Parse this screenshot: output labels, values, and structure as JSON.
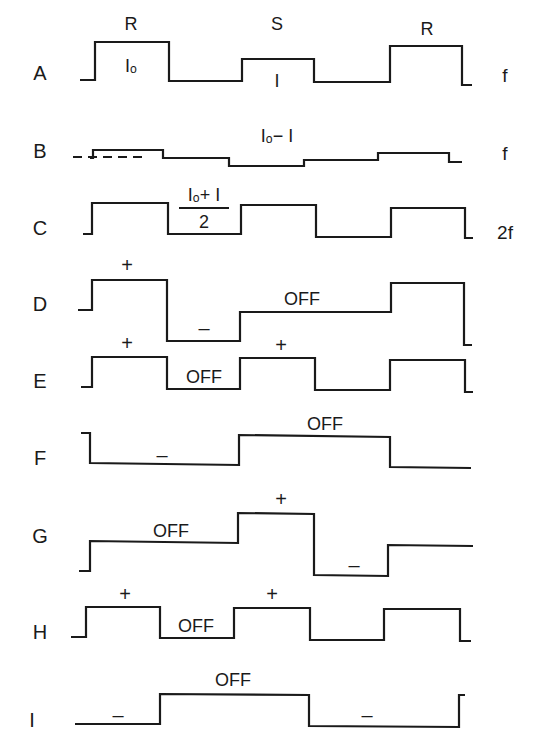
{
  "diagram": {
    "stroke_color": "#1a1a1a",
    "background": "#ffffff",
    "rows": [
      {
        "id": "A",
        "label": "A",
        "label_pos": [
          40,
          80
        ],
        "freq": "f",
        "freq_pos": [
          505,
          82
        ],
        "points": [
          [
            80,
            80
          ],
          [
            95,
            80
          ],
          [
            95,
            42
          ],
          [
            169,
            42
          ],
          [
            169,
            81
          ],
          [
            242,
            81
          ],
          [
            242,
            59
          ],
          [
            314,
            59
          ],
          [
            314,
            82
          ],
          [
            390,
            82
          ],
          [
            390,
            46
          ],
          [
            462,
            46
          ],
          [
            462,
            85
          ],
          [
            472,
            85
          ]
        ],
        "annotations": [
          {
            "text": "R",
            "pos": [
              131,
              30
            ],
            "cls": "annot"
          },
          {
            "text": "Iₒ",
            "pos": [
              131,
              72
            ],
            "cls": "annot"
          },
          {
            "text": "S",
            "pos": [
              277,
              30
            ],
            "cls": "annot"
          },
          {
            "text": "I",
            "pos": [
              277,
              87
            ],
            "cls": "annot"
          },
          {
            "text": "R",
            "pos": [
              427,
              35
            ],
            "cls": "annot"
          }
        ]
      },
      {
        "id": "B",
        "label": "B",
        "label_pos": [
          40,
          158
        ],
        "freq": "f",
        "freq_pos": [
          505,
          160
        ],
        "points": [
          [
            90,
            158
          ],
          [
            93,
            158
          ],
          [
            93,
            150
          ],
          [
            163,
            150
          ],
          [
            163,
            158
          ],
          [
            229,
            158
          ],
          [
            229,
            166
          ],
          [
            304,
            166
          ],
          [
            304,
            160
          ],
          [
            378,
            160
          ],
          [
            378,
            153
          ],
          [
            449,
            153
          ],
          [
            449,
            162
          ],
          [
            462,
            162
          ]
        ],
        "dashed": [
          [
            73,
            157
          ],
          [
            145,
            157
          ]
        ],
        "annotations": [
          {
            "text": "Iₒ− I",
            "pos": [
              277,
              142
            ],
            "cls": "annot"
          }
        ]
      },
      {
        "id": "C",
        "label": "C",
        "label_pos": [
          40,
          235
        ],
        "freq": "2f",
        "freq_pos": [
          505,
          239
        ],
        "points": [
          [
            83,
            234
          ],
          [
            92,
            234
          ],
          [
            92,
            203
          ],
          [
            168,
            203
          ],
          [
            168,
            234
          ],
          [
            241,
            234
          ],
          [
            241,
            205
          ],
          [
            316,
            205
          ],
          [
            316,
            237
          ],
          [
            391,
            237
          ],
          [
            391,
            208
          ],
          [
            465,
            208
          ],
          [
            465,
            238
          ],
          [
            473,
            238
          ]
        ],
        "annotations": [
          {
            "text": "Iₒ+ I",
            "pos": [
              204,
              201
            ],
            "cls": "annot"
          },
          {
            "text": "2",
            "pos": [
              204,
              228
            ],
            "cls": "annot"
          }
        ],
        "fraction_bar": [
          [
            179,
            208
          ],
          [
            229,
            208
          ]
        ]
      },
      {
        "id": "D",
        "label": "D",
        "label_pos": [
          40,
          311
        ],
        "freq": "",
        "points": [
          [
            78,
            310
          ],
          [
            92,
            310
          ],
          [
            92,
            280
          ],
          [
            167,
            280
          ],
          [
            167,
            341
          ],
          [
            240,
            341
          ],
          [
            240,
            312
          ],
          [
            391,
            312
          ],
          [
            391,
            283
          ],
          [
            464,
            283
          ],
          [
            464,
            345
          ],
          [
            472,
            345
          ]
        ],
        "annotations": [
          {
            "text": "+",
            "pos": [
              127,
              272
            ],
            "cls": "sign"
          },
          {
            "text": "–",
            "pos": [
              204,
              335
            ],
            "cls": "sign"
          },
          {
            "text": "OFF",
            "pos": [
              302,
              305
            ],
            "cls": "annot"
          }
        ]
      },
      {
        "id": "E",
        "label": "E",
        "label_pos": [
          40,
          388
        ],
        "freq": "",
        "points": [
          [
            81,
            387
          ],
          [
            92,
            387
          ],
          [
            92,
            357
          ],
          [
            167,
            357
          ],
          [
            167,
            389
          ],
          [
            240,
            389
          ],
          [
            240,
            358
          ],
          [
            315,
            358
          ],
          [
            315,
            390
          ],
          [
            390,
            390
          ],
          [
            390,
            360
          ],
          [
            465,
            360
          ],
          [
            465,
            392
          ],
          [
            473,
            392
          ]
        ],
        "annotations": [
          {
            "text": "+",
            "pos": [
              127,
              350
            ],
            "cls": "sign"
          },
          {
            "text": "OFF",
            "pos": [
              204,
              383
            ],
            "cls": "annot"
          },
          {
            "text": "+",
            "pos": [
              281,
              352
            ],
            "cls": "sign"
          }
        ]
      },
      {
        "id": "F",
        "label": "F",
        "label_pos": [
          40,
          465
        ],
        "freq": "",
        "points": [
          [
            81,
            433
          ],
          [
            90,
            433
          ],
          [
            90,
            463
          ],
          [
            239,
            465
          ],
          [
            239,
            435
          ],
          [
            390,
            437
          ],
          [
            390,
            467
          ],
          [
            471,
            468
          ]
        ],
        "annotations": [
          {
            "text": "–",
            "pos": [
              162,
              462
            ],
            "cls": "sign"
          },
          {
            "text": "OFF",
            "pos": [
              325,
              430
            ],
            "cls": "annot"
          }
        ]
      },
      {
        "id": "G",
        "label": "G",
        "label_pos": [
          40,
          543
        ],
        "freq": "",
        "points": [
          [
            79,
            571
          ],
          [
            90,
            571
          ],
          [
            90,
            541
          ],
          [
            238,
            543
          ],
          [
            238,
            513
          ],
          [
            314,
            514
          ],
          [
            314,
            575
          ],
          [
            388,
            576
          ],
          [
            388,
            545
          ],
          [
            473,
            546
          ]
        ],
        "annotations": [
          {
            "text": "OFF",
            "pos": [
              171,
              537
            ],
            "cls": "annot"
          },
          {
            "text": "+",
            "pos": [
              281,
              506
            ],
            "cls": "sign"
          },
          {
            "text": "–",
            "pos": [
              354,
              572
            ],
            "cls": "sign"
          }
        ]
      },
      {
        "id": "H",
        "label": "H",
        "label_pos": [
          40,
          639
        ],
        "freq": "",
        "points": [
          [
            71,
            637
          ],
          [
            86,
            637
          ],
          [
            86,
            607
          ],
          [
            160,
            607
          ],
          [
            160,
            638
          ],
          [
            234,
            638
          ],
          [
            234,
            608
          ],
          [
            310,
            608
          ],
          [
            310,
            640
          ],
          [
            384,
            640
          ],
          [
            384,
            609
          ],
          [
            460,
            609
          ],
          [
            460,
            641
          ],
          [
            471,
            641
          ]
        ],
        "annotations": [
          {
            "text": "+",
            "pos": [
              125,
              601
            ],
            "cls": "sign"
          },
          {
            "text": "OFF",
            "pos": [
              196,
              632
            ],
            "cls": "annot"
          },
          {
            "text": "+",
            "pos": [
              272,
              601
            ],
            "cls": "sign"
          }
        ]
      },
      {
        "id": "I",
        "label": "I",
        "label_pos": [
          32,
          727
        ],
        "freq": "",
        "points": [
          [
            75,
            724
          ],
          [
            160,
            724
          ],
          [
            160,
            694
          ],
          [
            309,
            695
          ],
          [
            309,
            726
          ],
          [
            459,
            727
          ],
          [
            459,
            695
          ],
          [
            465,
            695
          ]
        ],
        "annotations": [
          {
            "text": "–",
            "pos": [
              118,
              722
            ],
            "cls": "sign"
          },
          {
            "text": "OFF",
            "pos": [
              233,
              686
            ],
            "cls": "annot"
          },
          {
            "text": "–",
            "pos": [
              367,
              722
            ],
            "cls": "sign"
          }
        ]
      }
    ]
  }
}
